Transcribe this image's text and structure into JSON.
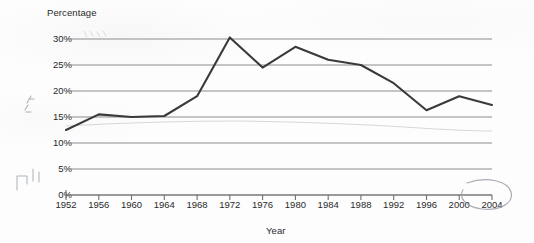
{
  "document": {
    "kind": "scanned-line-chart",
    "paper_color": "#fdfdfd",
    "ink_color": "#3a3a3a",
    "gridline_color": "#8c8c8c",
    "annotation_color": "#9aa0a8"
  },
  "chart_data": {
    "type": "line",
    "title": "",
    "xlabel": "Year",
    "ylabel": "Percentage",
    "x": [
      1952,
      1956,
      1960,
      1964,
      1968,
      1972,
      1976,
      1980,
      1984,
      1988,
      1992,
      1996,
      2000,
      2004
    ],
    "categories": [
      "1952",
      "1956",
      "1960",
      "1964",
      "1968",
      "1972",
      "1976",
      "1980",
      "1984",
      "1988",
      "1992",
      "1996",
      "2000",
      "2004"
    ],
    "values": [
      12.5,
      15.5,
      15.0,
      15.2,
      19.0,
      30.3,
      24.5,
      28.5,
      26.0,
      25.0,
      21.5,
      16.3,
      19.0,
      17.3
    ],
    "series": [
      {
        "name": "Percentage",
        "values": [
          12.5,
          15.5,
          15.0,
          15.2,
          19.0,
          30.3,
          24.5,
          28.5,
          26.0,
          25.0,
          21.5,
          16.3,
          19.0,
          17.3
        ]
      }
    ],
    "ylim": [
      0,
      30
    ],
    "xlim": [
      1952,
      2004
    ],
    "ytick_labels": [
      "0%",
      "5%",
      "10%",
      "15%",
      "20%",
      "25%",
      "30%"
    ],
    "ytick_values": [
      0,
      5,
      10,
      15,
      20,
      25,
      30
    ],
    "grid": true,
    "grid_axis": "y",
    "legend": false,
    "legend_position": "none"
  },
  "annotations": {
    "circle_around_label": "2004",
    "margin_marks": [
      "handwritten-mark-left-upper",
      "handwritten-mark-left-lower"
    ]
  }
}
